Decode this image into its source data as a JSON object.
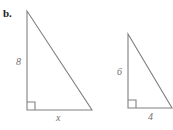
{
  "figure": {
    "part_label": "b.",
    "background_color": "#ffffff",
    "stroke_color": "#808080",
    "label_color": "#6f6f6f",
    "part_label_color": "#1a1a1a",
    "width": 173,
    "height": 130
  },
  "triangles": [
    {
      "name": "left-triangle",
      "apex": {
        "x": 27,
        "y": 11
      },
      "right_angle_vertex": {
        "x": 27,
        "y": 110
      },
      "base_vertex": {
        "x": 92,
        "y": 110
      },
      "right_angle_marker_size": 8,
      "labels": {
        "vertical_leg": "8",
        "horizontal_leg": "x",
        "hypotenuse": ""
      }
    },
    {
      "name": "right-triangle",
      "apex": {
        "x": 128,
        "y": 34
      },
      "right_angle_vertex": {
        "x": 128,
        "y": 108
      },
      "base_vertex": {
        "x": 172,
        "y": 108
      },
      "right_angle_marker_size": 8,
      "labels": {
        "vertical_leg": "6",
        "horizontal_leg": "4",
        "hypotenuse": ""
      }
    }
  ],
  "annotations": {
    "left_vertical_label": "8",
    "left_horizontal_label": "x",
    "right_vertical_label": "6",
    "right_horizontal_label": "4"
  }
}
